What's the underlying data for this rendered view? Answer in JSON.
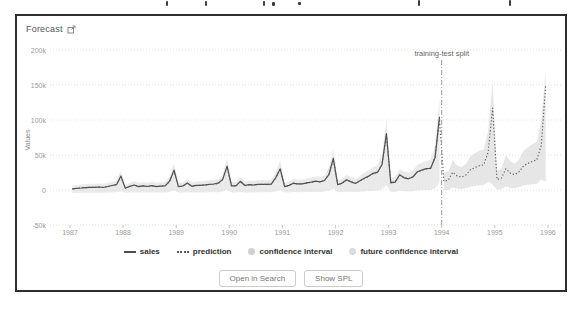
{
  "panel": {
    "title": "Forecast",
    "title_icon": "external-link-icon"
  },
  "actions": {
    "open_in_search": "Open in Search",
    "show_spl": "Show SPL"
  },
  "chart_data": {
    "type": "line",
    "title": "Forecast",
    "xlabel": "",
    "ylabel": "Values",
    "ylim": [
      -50000,
      200000
    ],
    "grid": "horizontal-dotted",
    "legend_position": "bottom",
    "x_ticks": [
      1987,
      1988,
      1989,
      1990,
      1991,
      1992,
      1993,
      1994,
      1995,
      1996
    ],
    "y_ticks": [
      {
        "value": 200000,
        "label": "200k"
      },
      {
        "value": 150000,
        "label": "150k"
      },
      {
        "value": 100000,
        "label": "100k"
      },
      {
        "value": 50000,
        "label": "50k"
      },
      {
        "value": 0,
        "label": "0"
      },
      {
        "value": -50000,
        "label": "-50k"
      }
    ],
    "annotation": {
      "label": "training-test split",
      "x": 1994.0
    },
    "x_unit": "monthly, decimal years",
    "series": [
      {
        "name": "confidence interval",
        "type": "band",
        "color": "#d9d9d9",
        "opacity": 0.55,
        "start": 1987.0,
        "upper": [
          6400,
          6900,
          7900,
          8100,
          8900,
          8800,
          9300,
          8900,
          10000,
          11600,
          14000,
          27100,
          7600,
          10100,
          12600,
          10400,
          11100,
          10500,
          11500,
          10400,
          10800,
          11600,
          18900,
          38000,
          10300,
          10900,
          15800,
          11000,
          11900,
          12500,
          12900,
          13900,
          14400,
          15800,
          22300,
          44600,
          11600,
          11500,
          18600,
          12400,
          13100,
          13300,
          13900,
          14300,
          14000,
          15000,
          25300,
          42800,
          10500,
          11900,
          16500,
          14600,
          15100,
          16400,
          17800,
          19100,
          18900,
          20500,
          32100,
          58400,
          14000,
          15900,
          21500,
          18900,
          16100,
          19900,
          24300,
          28100,
          33000,
          35000,
          50300,
          100900,
          17500,
          18800,
          30100,
          26300,
          24500,
          27800,
          35800,
          38900,
          41300,
          43400,
          63400,
          130100
        ],
        "lower": [
          -4200,
          -4150,
          -4050,
          -4000,
          -3900,
          -3950,
          -3850,
          -3900,
          -3800,
          -3600,
          -3300,
          -1700,
          -4050,
          -3750,
          -3450,
          -3750,
          -3650,
          -3700,
          -3600,
          -3750,
          -3700,
          -3600,
          -2700,
          -400,
          -3750,
          -3700,
          -3100,
          -3650,
          -3550,
          -3500,
          -3450,
          -3300,
          -3250,
          -3100,
          -2300,
          400,
          -3600,
          -3600,
          -2750,
          -3500,
          -3400,
          -3400,
          -3300,
          -3250,
          -3300,
          -3200,
          -1950,
          150,
          -3700,
          -3550,
          -3000,
          -3250,
          -3150,
          -3000,
          -2850,
          -2700,
          -2700,
          -2500,
          -1100,
          2000,
          -3300,
          -3050,
          -2400,
          -2700,
          -3050,
          -2600,
          -2050,
          -1600,
          -1000,
          -800,
          1050,
          7100,
          -2900,
          -2700,
          -1350,
          -1800,
          -2000,
          -1650,
          -700,
          -300,
          0,
          200,
          2600,
          10600
        ]
      },
      {
        "name": "future confidence interval",
        "type": "band",
        "color": "#d6d6d6",
        "opacity": 0.6,
        "start": 1994.0,
        "upper": [
          24100,
          26300,
          43000,
          35000,
          32800,
          37200,
          48100,
          52400,
          56000,
          58200,
          84300,
          155000,
          27800,
          30700,
          50200,
          40800,
          37900,
          43700,
          56000,
          61100,
          65500,
          68400,
          98800,
          172000
        ],
        "lower": [
          -200,
          200,
          3700,
          2000,
          1600,
          2500,
          4700,
          5600,
          6400,
          6800,
          12200,
          8000,
          500,
          1100,
          5200,
          3200,
          2600,
          3800,
          6400,
          7400,
          8300,
          8900,
          15200,
          12000
        ]
      },
      {
        "name": "sales",
        "type": "line",
        "style": "solid",
        "color": "#4d4d4d",
        "width": 1.2,
        "start": 1987.0,
        "values": [
          1700,
          2400,
          2800,
          3500,
          3800,
          3700,
          4300,
          3600,
          5000,
          6400,
          7600,
          19800,
          2500,
          5200,
          7200,
          4800,
          5900,
          5000,
          6200,
          4800,
          5500,
          5800,
          12600,
          28500,
          4700,
          5700,
          10000,
          5300,
          6500,
          6600,
          7300,
          8200,
          8600,
          9700,
          15200,
          34100,
          5900,
          5800,
          12400,
          6400,
          7600,
          7200,
          8100,
          8000,
          8100,
          8500,
          17900,
          30100,
          4800,
          6500,
          9600,
          8800,
          8700,
          10200,
          11300,
          12600,
          11600,
          13600,
          21800,
          45100,
          7600,
          9800,
          14600,
          11600,
          9300,
          13100,
          16700,
          19900,
          23900,
          25400,
          36000,
          80700,
          10200,
          11300,
          21800,
          17400,
          16000,
          18600,
          26200,
          28600,
          30500,
          30800,
          46600,
          104700
        ]
      },
      {
        "name": "prediction",
        "type": "line",
        "style": "dotted",
        "color": "#5c5c5c",
        "width": 1.1,
        "start": 1987.0,
        "values": [
          1900,
          2300,
          3100,
          3300,
          3900,
          3800,
          4200,
          3900,
          4800,
          6100,
          8000,
          18500,
          2900,
          4900,
          6900,
          5100,
          5700,
          5200,
          6000,
          5100,
          5400,
          6100,
          11900,
          27200,
          5000,
          5500,
          9400,
          5600,
          6300,
          6800,
          7100,
          7900,
          8300,
          9400,
          14600,
          32500,
          6100,
          6000,
          11700,
          6700,
          7300,
          7400,
          7900,
          8200,
          8000,
          8800,
          17000,
          31000,
          5200,
          6300,
          10000,
          8500,
          8900,
          9900,
          11000,
          12100,
          11900,
          13200,
          22500,
          43500,
          8000,
          9500,
          14000,
          11900,
          9700,
          12700,
          16200,
          19300,
          23200,
          24800,
          37000,
          77500,
          10800,
          11800,
          20900,
          17800,
          16400,
          19000,
          25400,
          27900,
          29800,
          31500,
          47500,
          100900,
          12500,
          14000,
          25500,
          20000,
          18500,
          21500,
          29000,
          32000,
          34500,
          36000,
          54000,
          117000,
          15000,
          17000,
          30500,
          24000,
          22000,
          26000,
          34500,
          38000,
          41000,
          43000,
          64000,
          150000
        ]
      }
    ],
    "legend": [
      {
        "label": "sales",
        "marker": "line"
      },
      {
        "label": "prediction",
        "marker": "dotted-line"
      },
      {
        "label": "confidence interval",
        "marker": "circle"
      },
      {
        "label": "future confidence interval",
        "marker": "circle"
      }
    ]
  }
}
